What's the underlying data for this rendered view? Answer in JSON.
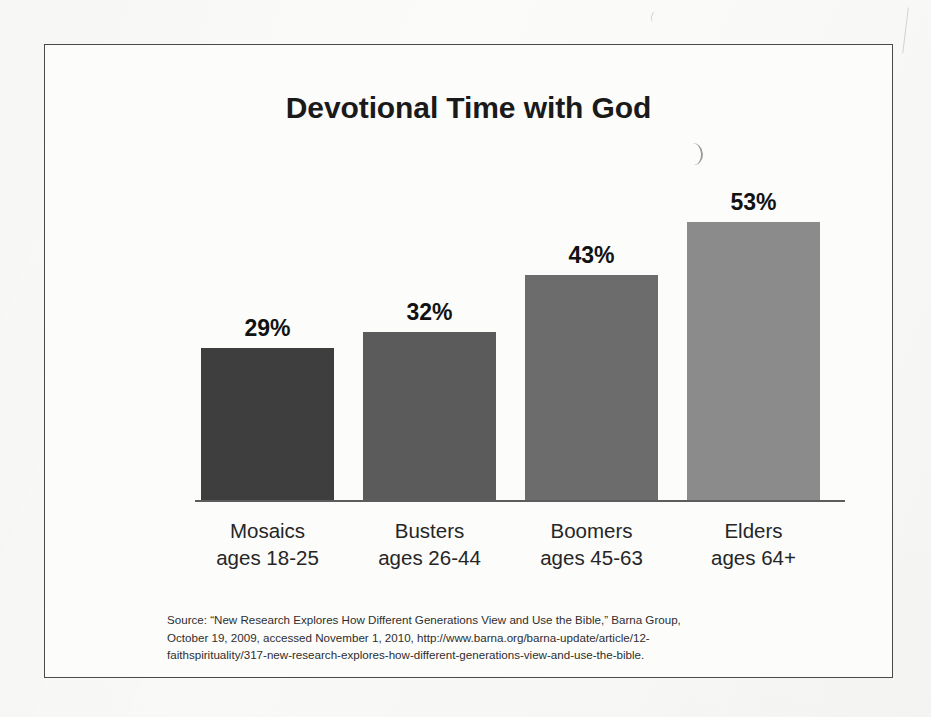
{
  "chart_data": {
    "type": "bar",
    "title": "Devotional Time with God",
    "xlabel": "",
    "ylabel": "",
    "ylim": [
      0,
      60
    ],
    "grid": false,
    "legend": "none",
    "categories": [
      "Mosaics",
      "Busters",
      "Boomers",
      "Elders"
    ],
    "category_sublabels": [
      "ages 18-25",
      "ages 26-44",
      "ages 45-63",
      "ages 64+"
    ],
    "values": [
      29,
      32,
      43,
      53
    ],
    "value_labels": [
      "29%",
      "32%",
      "43%",
      "53%"
    ],
    "bar_colors": [
      "#3e3e3e",
      "#5b5b5b",
      "#6c6c6c",
      "#8b8b8b"
    ],
    "axis_color": "#5c5c5c"
  },
  "source": {
    "line1": "Source: “New Research Explores How Different Generations View and Use the Bible,” Barna Group,",
    "line2": "October 19, 2009, accessed November 1, 2010, http://www.barna.org/barna-update/article/12-",
    "line3": "faithspirituality/317-new-research-explores-how-different-generations-view-and-use-the-bible."
  }
}
